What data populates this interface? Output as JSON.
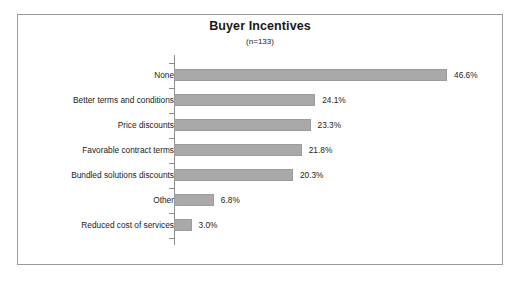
{
  "chart_data": {
    "type": "bar",
    "orientation": "horizontal",
    "title": "Buyer Incentives",
    "subtitle": "(n=133)",
    "xlabel": "",
    "ylabel": "",
    "grid": false,
    "legend": false,
    "xlim": [
      0,
      50
    ],
    "value_suffix": "%",
    "categories": [
      "None",
      "Better terms and conditions",
      "Price discounts",
      "Favorable contract terms",
      "Bundled solutions discounts",
      "Other",
      "Reduced cost of services"
    ],
    "values": [
      46.6,
      24.1,
      23.3,
      21.8,
      20.3,
      6.8,
      3.0
    ],
    "value_labels": [
      "46.6%",
      "24.1%",
      "23.3%",
      "21.8%",
      "20.3%",
      "6.8%",
      "3.0%"
    ],
    "colors": {
      "bar_fill": "#a9a9a9",
      "bar_border": "#9b9b9b",
      "axis": "#8c8c8c",
      "frame": "#9a9a9a",
      "text": "#1a1a1a",
      "background": "#ffffff"
    }
  }
}
